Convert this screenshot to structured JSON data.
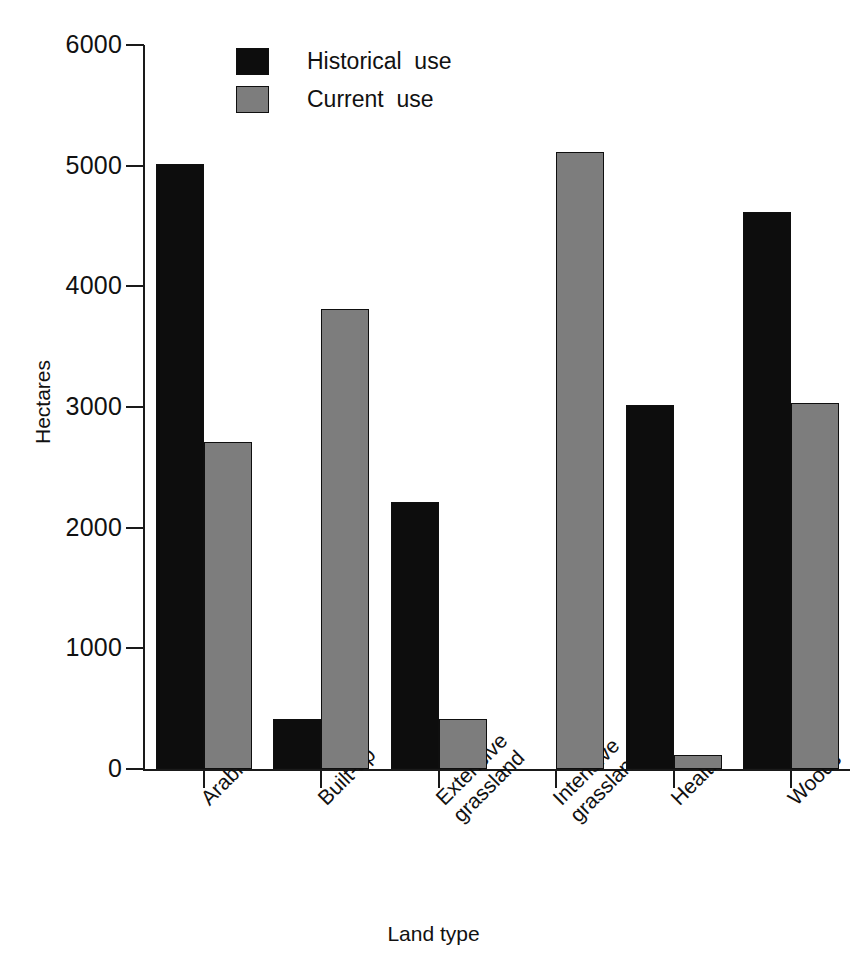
{
  "chart_data": {
    "type": "bar",
    "title": "",
    "subtitle": "",
    "xlabel": "Land type",
    "ylabel": "Hectares",
    "ylim": [
      0,
      6000
    ],
    "ytick_labels": [
      "0",
      "1000",
      "2000",
      "3000",
      "4000",
      "5000",
      "6000"
    ],
    "ytick_values": [
      0,
      1000,
      2000,
      3000,
      4000,
      5000,
      6000
    ],
    "grid": false,
    "legend_position": "top-center-left",
    "categories": [
      "Arable",
      "Built-up",
      "Extensive\ngrassland",
      "Intensive\ngrassland",
      "Health",
      "Woods"
    ],
    "category_lines": [
      [
        "Arable"
      ],
      [
        "Built-up"
      ],
      [
        "Extensive",
        "grassland"
      ],
      [
        "Intensive",
        "grassland"
      ],
      [
        "Health"
      ],
      [
        "Woods"
      ]
    ],
    "series": [
      {
        "name": "Historical  use",
        "color": "#0d0d0d",
        "values": [
          5010,
          415,
          2210,
          0,
          3020,
          4620
        ]
      },
      {
        "name": "Current  use",
        "color": "#7d7d7d",
        "values": [
          2710,
          3810,
          415,
          5110,
          120,
          3030
        ]
      }
    ]
  },
  "legend": {
    "items": [
      {
        "label": "Historical  use",
        "swatch": "historical-swatch"
      },
      {
        "label": "Current  use",
        "swatch": "current-swatch"
      }
    ]
  },
  "axes": {
    "y_title": "Hectares",
    "x_title": "Land type"
  },
  "colors": {
    "historical": "#0d0d0d",
    "current": "#7d7d7d",
    "axis": "#1a1a1a",
    "background": "#ffffff"
  }
}
